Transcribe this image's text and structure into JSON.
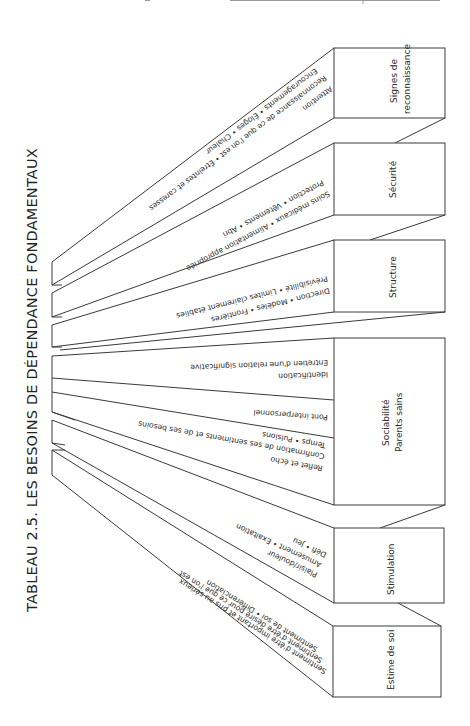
{
  "title": "TABLEAU 2.5. LES BESOINS DE DÉPENDANCE FONDAMENTAUX",
  "colors": {
    "line": "#3a3a3a",
    "text": "#2a2a2a",
    "background": "#ffffff"
  },
  "categories": [
    {
      "name": "Signes de reconnaissance",
      "label_lines": [
        "Signes de",
        "reconnaissance"
      ],
      "items": [
        "Encouragements • Éloges • Chaleur",
        "Reconnaissance de ce que l'on est • Étreintes et caresses",
        "Attention"
      ]
    },
    {
      "name": "Sécurité",
      "label_lines": [
        "Sécurité"
      ],
      "items": [
        "Protection • Vêtements • Abri",
        "Soins médicaux • Alimentation appropriée"
      ]
    },
    {
      "name": "Structure",
      "label_lines": [
        "Structure"
      ],
      "items": [
        "Prévisibilité • Limites clairement établies",
        "Direction • Modèles • Frontières"
      ]
    },
    {
      "name": "Sociabilité / Parents sains",
      "label_lines": [
        "Sociabilité",
        "Parents sains"
      ],
      "segments": [
        {
          "items": [
            "Entretien d'une relation significative",
            "Identification"
          ]
        },
        {
          "items": [
            "Pont interpersonnel"
          ]
        },
        {
          "items": [
            "Temps • Pulsions",
            "Confirmation de ses sentiments et de ses besoins",
            "Reflet et écho"
          ]
        }
      ]
    },
    {
      "name": "Stimulation",
      "label_lines": [
        "Stimulation"
      ],
      "items": [
        "Défi • Jeu",
        "Amusement • Exaltation",
        "Plaisir/douleur"
      ]
    },
    {
      "name": "Estime de soi",
      "label_lines": [
        "Estime de soi"
      ],
      "items": [
        "Sentiment de soi • Différenciation",
        "Sentiment d'être désiré pour ce que l'on est",
        "Sentiment d'être important et pris au sérieux"
      ]
    }
  ]
}
